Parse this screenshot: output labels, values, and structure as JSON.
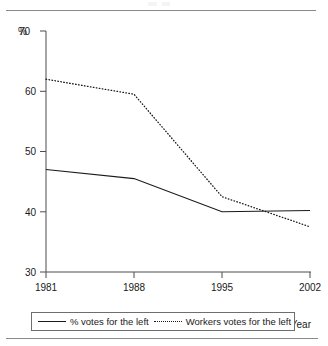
{
  "chart_data": {
    "type": "line",
    "title": "",
    "subtitle": "",
    "xlabel": "Year",
    "ylabel": "%",
    "x": [
      1981,
      1988,
      1995,
      2002
    ],
    "categories": [
      "1981",
      "1988",
      "1995",
      "2002"
    ],
    "xlim": [
      1981,
      2002
    ],
    "ylim": [
      30,
      70
    ],
    "xticks": [
      "1981",
      "1988",
      "1995",
      "2002"
    ],
    "yticks": [
      "30",
      "40",
      "50",
      "60",
      "70"
    ],
    "grid": false,
    "legend_position": "bottom",
    "series": [
      {
        "name": "% votes for the left",
        "style": "solid",
        "color": "#1a1a1a",
        "values": [
          47.0,
          45.5,
          40.0,
          40.2
        ]
      },
      {
        "name": "Workers votes for the left",
        "style": "dotted",
        "color": "#1a1a1a",
        "values": [
          62.0,
          59.5,
          42.5,
          37.5
        ]
      }
    ]
  },
  "axis": {
    "y_unit_label": "%",
    "y_tick_70": "70",
    "y_tick_60": "60",
    "y_tick_50": "50",
    "y_tick_40": "40",
    "y_tick_30": "30",
    "x_tick_1981": "1981",
    "x_tick_1988": "1988",
    "x_tick_1995": "1995",
    "x_tick_2002": "2002",
    "x_axis_title": "Year"
  },
  "legend": {
    "items": [
      {
        "label": "% votes for the left",
        "style": "solid"
      },
      {
        "label": "Workers votes for the left",
        "style": "dotted"
      }
    ]
  }
}
